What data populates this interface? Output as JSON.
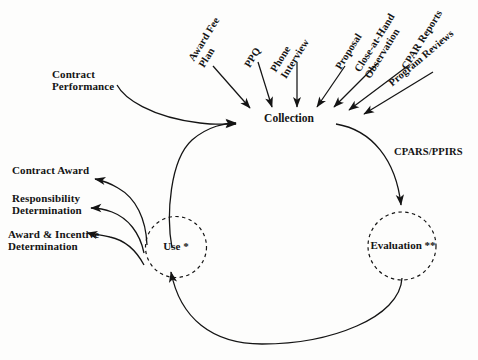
{
  "diagram": {
    "background_color": "#fdfdfc",
    "ink_color": "#141414"
  },
  "nodes": {
    "collection": {
      "label": "Collection",
      "shape": "text"
    },
    "use": {
      "label": "Use *",
      "shape": "dashed-circle"
    },
    "evaluation": {
      "label": "Evaluation **",
      "shape": "dashed-circle"
    }
  },
  "inputs": {
    "heading": "Collection inputs",
    "items": [
      {
        "label": "Award Fee\nPlan",
        "rotation": -58
      },
      {
        "label": "PPQ",
        "rotation": -58
      },
      {
        "label": "Phone\nInterview",
        "rotation": -58
      },
      {
        "label": "Proposal",
        "rotation": -58
      },
      {
        "label": "Close-at-Hand\nObservation",
        "rotation": -58
      },
      {
        "label": "CPAR Reports",
        "rotation": -58
      },
      {
        "label": "Program Reviews",
        "rotation": -40
      }
    ]
  },
  "side_inputs": {
    "contract_performance": "Contract\nPerformance"
  },
  "outputs": {
    "items": [
      {
        "label": "Contract Award"
      },
      {
        "label": "Responsibility\nDetermination"
      },
      {
        "label": "Award & Incentive\nDetermination"
      }
    ]
  },
  "edge_labels": {
    "cpars_ppirs": "CPARS/PPIRS"
  }
}
